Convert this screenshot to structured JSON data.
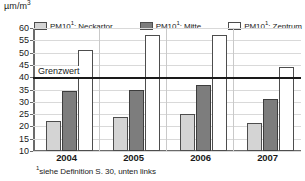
{
  "chart_data": {
    "type": "bar",
    "title": "",
    "xlabel": "",
    "ylabel": "µm/m³",
    "ylabel_plain": "µm/m3",
    "categories": [
      "2004",
      "2005",
      "2006",
      "2007"
    ],
    "series": [
      {
        "name": "PM10¹: Neckartor",
        "name_plain": "PM10 1: Neckartor",
        "values": [
          22,
          24,
          25,
          21.5
        ],
        "color": "#d4d4d4"
      },
      {
        "name": "PM10¹: Mitte",
        "name_plain": "PM10 1: Mitte",
        "values": [
          34.5,
          35,
          37,
          31
        ],
        "color": "#7d7d7d"
      },
      {
        "name": "PM10¹: Zentrum",
        "name_plain": "PM10 1: Zentrum",
        "values": [
          51,
          57,
          57,
          44
        ],
        "color": "#ffffff"
      }
    ],
    "ylim": [
      10,
      60
    ],
    "yticks": [
      10,
      15,
      20,
      25,
      30,
      35,
      40,
      45,
      50,
      55,
      60
    ],
    "grid": true,
    "legend_position": "top",
    "annotations": [
      {
        "label": "Grenzwert",
        "value": 40,
        "type": "threshold-line"
      }
    ]
  },
  "legend": {
    "items": [
      {
        "base": "PM10",
        "sup": "1",
        "rest": ": Neckartor",
        "swatch": "light"
      },
      {
        "base": "PM10",
        "sup": "1",
        "rest": ": Mitte",
        "swatch": "dark"
      },
      {
        "base": "PM10",
        "sup": "1",
        "rest": ": Zentrum",
        "swatch": "white"
      }
    ]
  },
  "axis": {
    "unit_base": "µm/m",
    "unit_sup": "3"
  },
  "threshold": {
    "label": "Grenzwert",
    "value": 40
  },
  "footnote": {
    "sup": "1",
    "text": "siehe Definition S. 30, unten links"
  },
  "colors": {
    "light": "#d4d4d4",
    "dark": "#7d7d7d",
    "white": "#ffffff",
    "grid": "#d9d9d9",
    "axis": "#6b6b6b",
    "threshold": "#1a1a1a"
  }
}
